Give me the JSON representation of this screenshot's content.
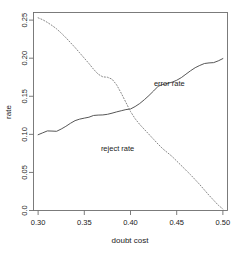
{
  "chart_data": {
    "type": "line",
    "title": "",
    "xlabel": "doubt cost",
    "ylabel": "rate",
    "xlim": [
      0.295,
      0.505
    ],
    "ylim": [
      0.0,
      0.26
    ],
    "grid": false,
    "legend_position": "inline-annotations",
    "xticks": [
      "0.30",
      "0.35",
      "0.40",
      "0.45",
      "0.50"
    ],
    "xtick_values": [
      0.3,
      0.35,
      0.4,
      0.45,
      0.5
    ],
    "yticks": [
      "0.0",
      "0.05",
      "0.10",
      "0.15",
      "0.20",
      "0.25"
    ],
    "ytick_values": [
      0.0,
      0.05,
      0.1,
      0.15,
      0.2,
      0.25
    ],
    "x": [
      0.3,
      0.305,
      0.31,
      0.315,
      0.32,
      0.325,
      0.33,
      0.335,
      0.34,
      0.345,
      0.35,
      0.355,
      0.36,
      0.365,
      0.37,
      0.375,
      0.38,
      0.385,
      0.39,
      0.395,
      0.4,
      0.405,
      0.41,
      0.415,
      0.42,
      0.425,
      0.43,
      0.435,
      0.44,
      0.445,
      0.45,
      0.455,
      0.46,
      0.465,
      0.47,
      0.475,
      0.48,
      0.485,
      0.49,
      0.495,
      0.5
    ],
    "series": [
      {
        "name": "error rate",
        "style": "solid",
        "color": "#4d4d4d",
        "label_x": 0.442,
        "label_y": 0.163,
        "values": [
          0.0995,
          0.102,
          0.1045,
          0.1043,
          0.104,
          0.107,
          0.1105,
          0.1145,
          0.118,
          0.12,
          0.1213,
          0.1225,
          0.1248,
          0.1253,
          0.1255,
          0.1263,
          0.1278,
          0.1295,
          0.131,
          0.1325,
          0.1333,
          0.1365,
          0.1405,
          0.1455,
          0.151,
          0.157,
          0.1632,
          0.1655,
          0.1668,
          0.1685,
          0.171,
          0.1745,
          0.179,
          0.1835,
          0.1875,
          0.1905,
          0.193,
          0.1938,
          0.1942,
          0.1965,
          0.1995
        ]
      },
      {
        "name": "reject rate",
        "style": "dotted",
        "color": "#808080",
        "label_x": 0.386,
        "label_y": 0.078,
        "values": [
          0.253,
          0.2505,
          0.247,
          0.243,
          0.2385,
          0.233,
          0.227,
          0.2205,
          0.214,
          0.207,
          0.2,
          0.193,
          0.1855,
          0.179,
          0.1755,
          0.175,
          0.1725,
          0.165,
          0.154,
          0.142,
          0.13,
          0.1205,
          0.113,
          0.1065,
          0.1,
          0.0935,
          0.087,
          0.081,
          0.076,
          0.071,
          0.065,
          0.059,
          0.053,
          0.047,
          0.0405,
          0.034,
          0.027,
          0.02,
          0.0135,
          0.007,
          0.002
        ]
      }
    ]
  },
  "axes": {
    "x_title": "doubt cost",
    "y_title": "rate"
  }
}
